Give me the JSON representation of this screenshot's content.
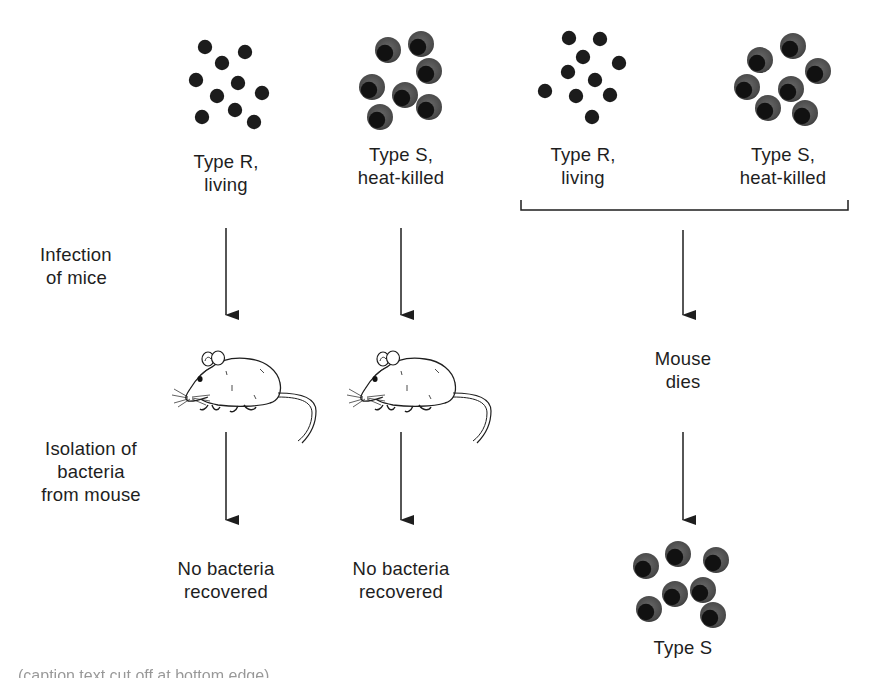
{
  "diagram": {
    "row_labels": {
      "infection": [
        "Infection",
        "of mice"
      ],
      "isolation": [
        "Isolation of",
        "bacteria",
        "from mouse"
      ]
    },
    "columns": [
      {
        "id": "col-1",
        "strain_label": [
          "Type R,",
          "living"
        ],
        "bacteria_type": "R",
        "bacteria_count": 10,
        "outcome": [
          "No bacteria",
          "recovered"
        ]
      },
      {
        "id": "col-2",
        "strain_label": [
          "Type S,",
          "heat-killed"
        ],
        "bacteria_type": "S",
        "bacteria_count": 7,
        "outcome": [
          "No bacteria",
          "recovered"
        ]
      },
      {
        "id": "col-3",
        "strain_labels": [
          {
            "label": [
              "Type R,",
              "living"
            ],
            "bacteria_type": "R",
            "bacteria_count": 10
          },
          {
            "label": [
              "Type S,",
              "heat-killed"
            ],
            "bacteria_type": "S",
            "bacteria_count": 7
          }
        ],
        "mouse_state": [
          "Mouse",
          "dies"
        ],
        "outcome_label": "Type S",
        "outcome_bacteria_type": "S",
        "outcome_bacteria_count": 7
      }
    ],
    "caption_partial": "(caption text cut off at bottom edge)",
    "colors": {
      "ink": "#1e1e1e",
      "capsule": "#555555",
      "core": "#111111",
      "background": "#ffffff"
    }
  }
}
